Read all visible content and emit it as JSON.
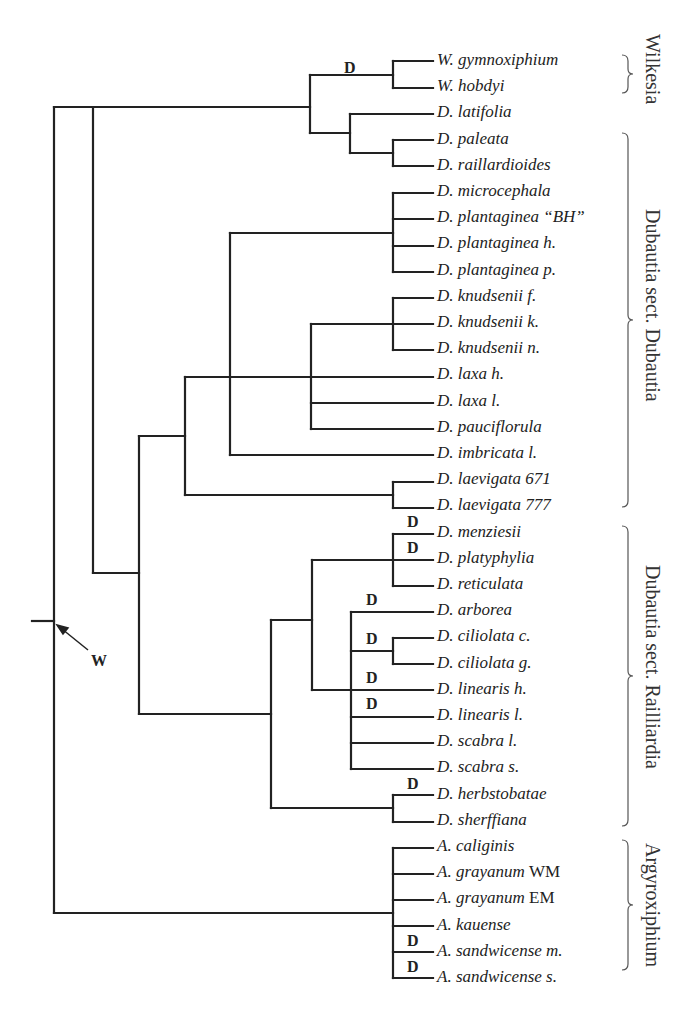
{
  "leaves": [
    {
      "name": "W. gymnoxiphium",
      "suffix": ""
    },
    {
      "name": "W. hobdyi",
      "suffix": ""
    },
    {
      "name": "D. latifolia",
      "suffix": ""
    },
    {
      "name": "D. paleata",
      "suffix": ""
    },
    {
      "name": "D. raillardioides",
      "suffix": ""
    },
    {
      "name": "D. microcephala",
      "suffix": ""
    },
    {
      "name": "D. plantaginea “BH”",
      "suffix": ""
    },
    {
      "name": "D. plantaginea h.",
      "suffix": ""
    },
    {
      "name": "D. plantaginea p.",
      "suffix": ""
    },
    {
      "name": "D. knudsenii f.",
      "suffix": ""
    },
    {
      "name": "D. knudsenii k.",
      "suffix": ""
    },
    {
      "name": "D. knudsenii n.",
      "suffix": ""
    },
    {
      "name": "D. laxa h.",
      "suffix": ""
    },
    {
      "name": "D. laxa l.",
      "suffix": ""
    },
    {
      "name": "D. pauciflorula",
      "suffix": ""
    },
    {
      "name": "D. imbricata l.",
      "suffix": ""
    },
    {
      "name": "D. laevigata 671",
      "suffix": ""
    },
    {
      "name": "D. laevigata 777",
      "suffix": ""
    },
    {
      "name": "D. menziesii",
      "suffix": ""
    },
    {
      "name": "D. platyphylia",
      "suffix": ""
    },
    {
      "name": "D. reticulata",
      "suffix": ""
    },
    {
      "name": "D. arborea",
      "suffix": ""
    },
    {
      "name": "D. ciliolata c.",
      "suffix": ""
    },
    {
      "name": "D. ciliolata g.",
      "suffix": ""
    },
    {
      "name": "D. linearis h.",
      "suffix": ""
    },
    {
      "name": "D. linearis l.",
      "suffix": ""
    },
    {
      "name": "D. scabra l.",
      "suffix": ""
    },
    {
      "name": "D. scabra s.",
      "suffix": ""
    },
    {
      "name": "D. herbstobatae",
      "suffix": ""
    },
    {
      "name": "D. sherffiana",
      "suffix": ""
    },
    {
      "name": "A. caliginis",
      "suffix": ""
    },
    {
      "name": "A. grayanum",
      "suffix": "WM"
    },
    {
      "name": "A. grayanum",
      "suffix": "EM"
    },
    {
      "name": "A. kauense",
      "suffix": ""
    },
    {
      "name": "A. sandwicense m.",
      "suffix": ""
    },
    {
      "name": "A. sandwicense s.",
      "suffix": ""
    }
  ],
  "groups": [
    {
      "label": "Wilkesia",
      "from_leaf": 0,
      "to_leaf": 1
    },
    {
      "label": "Dubautia sect. Dubautia",
      "from_leaf": 3,
      "to_leaf": 17
    },
    {
      "label": "Dubautia sect. Railliardia",
      "from_leaf": 18,
      "to_leaf": 29
    },
    {
      "label": "Argyroxiphium",
      "from_leaf": 30,
      "to_leaf": 35
    }
  ],
  "markers": {
    "d_label": "D",
    "w_label": "W"
  },
  "style": {
    "line_color": "#222222",
    "bracket_color": "#555555"
  }
}
